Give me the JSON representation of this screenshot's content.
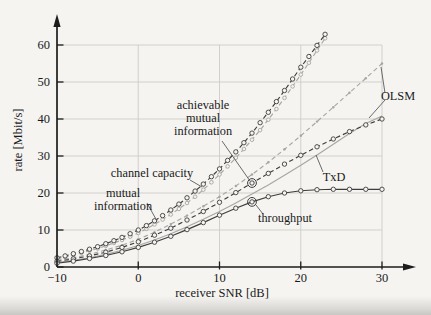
{
  "figure": {
    "kind": "scientific line plot",
    "background": "#f5f4f1"
  },
  "chart_data": {
    "type": "line",
    "title": "",
    "xlabel": "receiver SNR [dB]",
    "ylabel": "rate [Mbit/s]",
    "xlim": [
      -10,
      33
    ],
    "ylim": [
      0,
      65
    ],
    "grid": true,
    "legend_position": "none (annotated with leader lines)",
    "xticks": [
      -10,
      0,
      10,
      20,
      30
    ],
    "xtick_labels": [
      "−10",
      "0",
      "10",
      "20",
      "30"
    ],
    "yticks": [
      0,
      10,
      20,
      30,
      40,
      50,
      60
    ],
    "ytick_labels": [
      "0",
      "10",
      "20",
      "30",
      "40",
      "50",
      "60"
    ],
    "colors": {
      "dark": "#3d3d3d",
      "light": "#a8a6a2",
      "axis": "#1c1c1c",
      "grid": "#cfccc7",
      "leader": "#5a5a5a",
      "marker_fill": "#f5f4f1"
    },
    "series": [
      {
        "label": "mutual information",
        "role": "mutual-information",
        "color": "light",
        "dash": true,
        "marker": "circle",
        "marker_r": 1.8,
        "x0": -10,
        "dx": 1,
        "values": [
          2.2,
          2.7,
          3.2,
          3.8,
          4.4,
          5.0,
          5.7,
          6.5,
          7.3,
          8.2,
          9.2,
          10.3,
          11.5,
          12.8,
          14.2,
          15.7,
          17.3,
          19.0,
          20.9,
          22.9,
          25.0,
          27.2,
          29.5,
          31.9,
          34.4,
          37.0,
          39.8,
          42.7,
          45.7,
          48.8,
          52.0,
          55.2,
          58.5,
          61.8
        ]
      },
      {
        "label": "achievable mutual information (OLSM)",
        "role": "achievable-mutual-information-olsm",
        "color": "light",
        "dash": true,
        "marker": "dot",
        "marker_r": 1.2,
        "x0": -10,
        "dx": 2,
        "values": [
          1.8,
          2.5,
          3.4,
          4.6,
          5.9,
          7.5,
          9.4,
          11.6,
          13.9,
          16.4,
          19.0,
          21.9,
          25.0,
          28.3,
          31.8,
          35.5,
          39.3,
          43.2,
          47.1,
          51.0,
          55.0
        ]
      },
      {
        "label": "achievable mutual information (TxD)",
        "role": "achievable-mutual-information-txd",
        "color": "light",
        "dash": false,
        "marker": "none",
        "marker_r": 0,
        "x0": -10,
        "dx": 2,
        "values": [
          1.2,
          1.8,
          2.5,
          3.4,
          4.5,
          5.8,
          7.3,
          9.0,
          10.9,
          12.9,
          15.0,
          17.3,
          19.7,
          22.2,
          24.8,
          27.5,
          30.3,
          33.2,
          36.1,
          38.8,
          40.8
        ]
      },
      {
        "label": "channel capacity",
        "role": "channel-capacity",
        "color": "dark",
        "dash": true,
        "marker": "circle",
        "marker_r": 2.2,
        "x0": -10,
        "dx": 1,
        "values": [
          2.5,
          3.0,
          3.6,
          4.2,
          4.8,
          5.5,
          6.3,
          7.1,
          8.0,
          9.0,
          10.0,
          11.2,
          12.5,
          13.9,
          15.4,
          17.0,
          18.7,
          20.5,
          22.4,
          24.4,
          26.5,
          28.8,
          31.1,
          33.6,
          36.2,
          39.0,
          41.8,
          44.7,
          47.7,
          50.8,
          54.0,
          56.9,
          59.9,
          62.9
        ]
      },
      {
        "label": "throughput (OLSM)",
        "role": "throughput-olsm",
        "color": "dark",
        "dash": true,
        "marker": "circle",
        "marker_r": 2.2,
        "x0": -10,
        "dx": 2,
        "values": [
          1.5,
          2.2,
          3.0,
          4.0,
          5.3,
          6.8,
          8.6,
          10.5,
          12.7,
          15.0,
          17.5,
          20.1,
          22.7,
          25.3,
          27.8,
          30.2,
          32.5,
          34.6,
          36.6,
          38.4,
          40.0
        ]
      },
      {
        "label": "throughput (TxD)",
        "role": "throughput-txd",
        "color": "dark",
        "dash": false,
        "marker": "circle",
        "marker_r": 2.2,
        "x0": -10,
        "dx": 2,
        "values": [
          1.0,
          1.6,
          2.3,
          3.1,
          4.1,
          5.3,
          6.7,
          8.3,
          10.1,
          12.0,
          14.0,
          15.9,
          17.6,
          19.0,
          20.0,
          20.6,
          20.9,
          21.0,
          21.0,
          21.0,
          21.0
        ]
      }
    ],
    "callout_circles": [
      {
        "snr": 14,
        "value": 22.7,
        "points_to": "achievable mutual information"
      },
      {
        "snr": 14,
        "value": 17.6,
        "points_to": "throughput"
      }
    ],
    "annotations": [
      {
        "name": "achievable-mutual-information",
        "lines": [
          "achievable",
          "mutual",
          "information"
        ],
        "x": 203,
        "y": 109,
        "leaders": [
          [
            [
              222,
              141
            ],
            [
              250,
              181
            ]
          ]
        ]
      },
      {
        "name": "channel-capacity",
        "lines": [
          "channel capacity"
        ],
        "x": 152,
        "y": 177,
        "leaders": [
          [
            [
              190,
              180
            ],
            [
              202,
              187
            ]
          ]
        ]
      },
      {
        "name": "mutual-information",
        "lines": [
          "mutual",
          "information"
        ],
        "x": 123,
        "y": 197,
        "leaders": [
          [
            [
              147,
              203
            ],
            [
              157,
              221
            ]
          ]
        ]
      },
      {
        "name": "throughput",
        "lines": [
          "throughput"
        ],
        "x": 285,
        "y": 222,
        "leaders": [
          [
            [
              263,
              214
            ],
            [
              256,
              205
            ]
          ]
        ]
      },
      {
        "name": "olsm",
        "lines": [
          "OLSM"
        ],
        "x": 398,
        "y": 100,
        "leaders": [
          [
            [
              385,
              93
            ],
            [
              381,
              67
            ]
          ],
          [
            [
              385,
              100
            ],
            [
              369,
              118
            ]
          ]
        ]
      },
      {
        "name": "txd",
        "lines": [
          "TxD"
        ],
        "x": 334,
        "y": 181,
        "leaders": [
          [
            [
              323,
              172
            ],
            [
              316,
              155
            ]
          ]
        ]
      }
    ],
    "axes_px": {
      "x_origin": 57,
      "y_origin": 267,
      "px_per_db": 8.125,
      "px_per_mbit": 3.7,
      "x_axis_end": 404,
      "x_arrow_tip": 416,
      "y_axis_end": 26,
      "y_arrow_tip": 14,
      "grid_right": 382,
      "grid_top": 45
    }
  }
}
